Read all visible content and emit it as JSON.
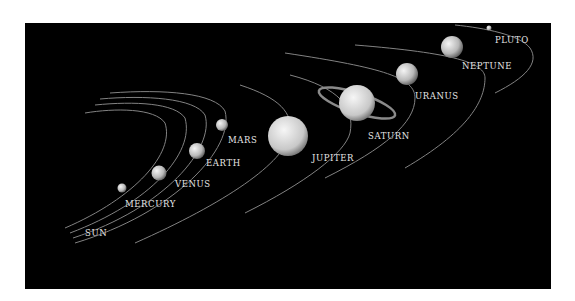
{
  "diagram": {
    "background_color": "#000000",
    "orbit_color": "#9a9a9a",
    "bodies": [
      {
        "name": "SUN",
        "label_x": 60,
        "label_y": 205
      },
      {
        "name": "MERCURY",
        "label_x": 100,
        "label_y": 176
      },
      {
        "name": "VENUS",
        "label_x": 150,
        "label_y": 156
      },
      {
        "name": "EARTH",
        "label_x": 181,
        "label_y": 135
      },
      {
        "name": "MARS",
        "label_x": 203,
        "label_y": 112
      },
      {
        "name": "JUPITER",
        "label_x": 287,
        "label_y": 130
      },
      {
        "name": "SATURN",
        "label_x": 343,
        "label_y": 108
      },
      {
        "name": "URANUS",
        "label_x": 390,
        "label_y": 68
      },
      {
        "name": "NEPTUNE",
        "label_x": 437,
        "label_y": 38
      },
      {
        "name": "PLUTO",
        "label_x": 470,
        "label_y": 12
      }
    ]
  }
}
